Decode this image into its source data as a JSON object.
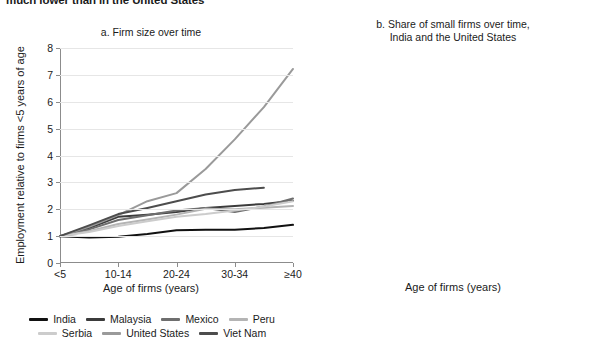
{
  "headline": "much lower than in the United States",
  "panel_a": {
    "title": "a. Firm size over time",
    "xlabel": "Age of firms (years)",
    "ylabel": "Employment relative to firms <5 years of age"
  },
  "panel_b": {
    "title_line1": "b. Share of small firms over time,",
    "title_line2": "India and the United States",
    "xlabel": "Age of firms (years)",
    "ylabel": "Share of small firms (%)"
  },
  "chart_data": [
    {
      "type": "line",
      "title": "a. Firm size over time",
      "xlabel": "Age of firms (years)",
      "ylabel": "Employment relative to firms <5 years of age",
      "categories": [
        "<5",
        "5-9",
        "10-14",
        "15-19",
        "20-24",
        "25-29",
        "30-34",
        "35-39",
        "≥40"
      ],
      "xtick_labels": [
        "<5",
        "10-14",
        "20-24",
        "30-34",
        "≥40"
      ],
      "xtick_indices": [
        0,
        2,
        4,
        6,
        8
      ],
      "ylim": [
        0,
        8
      ],
      "ytick_labels": [
        "0",
        "1",
        "2",
        "3",
        "4",
        "5",
        "6",
        "7",
        "8"
      ],
      "grid": true,
      "legend_position": "bottom",
      "series": [
        {
          "name": "India",
          "color": "#111111",
          "values": [
            1.0,
            0.95,
            0.98,
            1.08,
            1.22,
            1.24,
            1.24,
            1.3,
            1.42
          ]
        },
        {
          "name": "Malaysia",
          "color": "#3b3b3b",
          "values": [
            1.0,
            1.3,
            1.72,
            1.8,
            1.9,
            2.05,
            2.12,
            2.2,
            2.32
          ]
        },
        {
          "name": "Mexico",
          "color": "#6e6e6e",
          "values": [
            1.0,
            1.25,
            1.6,
            1.78,
            1.95,
            2.05,
            1.9,
            2.1,
            2.4
          ]
        },
        {
          "name": "Peru",
          "color": "#b4b4b4",
          "values": [
            1.0,
            1.18,
            1.45,
            1.62,
            1.8,
            2.02,
            2.0,
            2.06,
            2.12
          ]
        },
        {
          "name": "Serbia",
          "color": "#cccccc",
          "values": [
            1.0,
            1.15,
            1.38,
            1.55,
            1.72,
            1.82,
            1.95,
            2.1,
            2.3
          ]
        },
        {
          "name": "United States",
          "color": "#9a9a9a",
          "values": [
            1.0,
            1.35,
            1.78,
            2.3,
            2.6,
            3.5,
            4.6,
            5.8,
            7.22
          ]
        },
        {
          "name": "Viet Nam",
          "color": "#4d4d4d",
          "values": [
            1.0,
            1.4,
            1.82,
            2.05,
            2.3,
            2.55,
            2.72,
            2.8,
            null
          ]
        }
      ]
    },
    {
      "type": "line",
      "title": "b. Share of small firms over time, India and the United States",
      "xlabel": "Age of firms (years)",
      "ylabel": "Share of small firms (%)",
      "categories": [
        "0-5",
        "6-10",
        "11-15",
        "16-20",
        "21-25",
        "26+"
      ],
      "ylim": [
        0,
        100
      ],
      "ytick_labels": [
        "0",
        "10",
        "20",
        "30",
        "40",
        "50",
        "60",
        "70",
        "80",
        "90",
        "100"
      ],
      "grid": true,
      "legend_position": "bottom",
      "series": [
        {
          "name": "India",
          "color": "#111111",
          "values": [
            100,
            99,
            98,
            96.5,
            94,
            78
          ]
        },
        {
          "name": "United States",
          "color": "#b0b0b0",
          "values": [
            100,
            65,
            50,
            41,
            37,
            28
          ]
        }
      ]
    }
  ],
  "legend_a": [
    {
      "label": "India",
      "color": "#111111"
    },
    {
      "label": "Malaysia",
      "color": "#3b3b3b"
    },
    {
      "label": "Mexico",
      "color": "#6e6e6e"
    },
    {
      "label": "Peru",
      "color": "#b4b4b4"
    },
    {
      "label": "Serbia",
      "color": "#cccccc"
    },
    {
      "label": "United States",
      "color": "#9a9a9a"
    },
    {
      "label": "Viet Nam",
      "color": "#4d4d4d"
    }
  ],
  "legend_b": [
    {
      "label": "India",
      "color": "#111111"
    },
    {
      "label": "United States",
      "color": "#b0b0b0"
    }
  ]
}
